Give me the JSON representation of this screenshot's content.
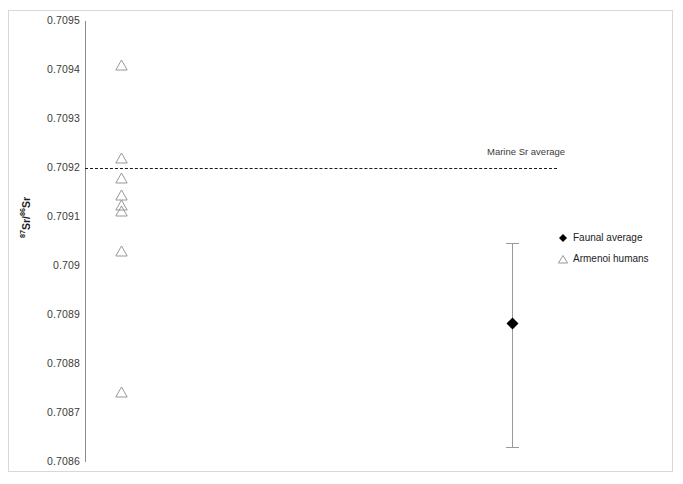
{
  "chart_data": {
    "type": "scatter",
    "title": "",
    "xlabel": "",
    "ylabel": "87Sr/86Sr",
    "ylim": [
      0.7086,
      0.7095
    ],
    "ytick_labels": [
      "0.7095",
      "0.7094",
      "0.7093",
      "0.7092",
      "0.7091",
      "0.709",
      "0.7089",
      "0.7088",
      "0.7087",
      "0.7086"
    ],
    "ytick_values": [
      0.7095,
      0.7094,
      0.7093,
      0.7092,
      0.7091,
      0.709,
      0.7089,
      0.7088,
      0.7087,
      0.7086
    ],
    "grid": false,
    "legend_position": "right",
    "series": [
      {
        "name": "Armenoi humans",
        "marker": "open-triangle",
        "color": "#8c8c8c",
        "x": 1,
        "values": [
          0.70941,
          0.70922,
          0.70918,
          0.709145,
          0.709125,
          0.709112,
          0.70903,
          0.708742
        ]
      },
      {
        "name": "Faunal average",
        "marker": "filled-diamond",
        "color": "#000000",
        "x": 2,
        "values": [
          0.708885
        ],
        "error_high": 0.709047,
        "error_low": 0.70863
      }
    ],
    "annotations": [
      {
        "name": "marine-sr-average",
        "label": "Marine Sr average",
        "type": "hline",
        "value": 0.7092,
        "style": "dashed"
      }
    ]
  },
  "axis": {
    "y_title_pre": "87",
    "y_title_mid": "Sr/",
    "y_title_sup2": "86",
    "y_title_post": "Sr"
  },
  "legend": {
    "items": [
      {
        "label": "Faunal average",
        "marker": "filled-diamond"
      },
      {
        "label": "Armenoi humans",
        "marker": "open-triangle"
      }
    ]
  },
  "annotation_labels": {
    "marine": "Marine Sr average"
  },
  "colors": {
    "marker_outline": "#8c8c8c",
    "faunal_marker": "#000000",
    "axis": "#8c8c8c",
    "frame": "#d8d8d8",
    "text": "#3b3b3b",
    "reference_line": "#1a1a1a"
  }
}
